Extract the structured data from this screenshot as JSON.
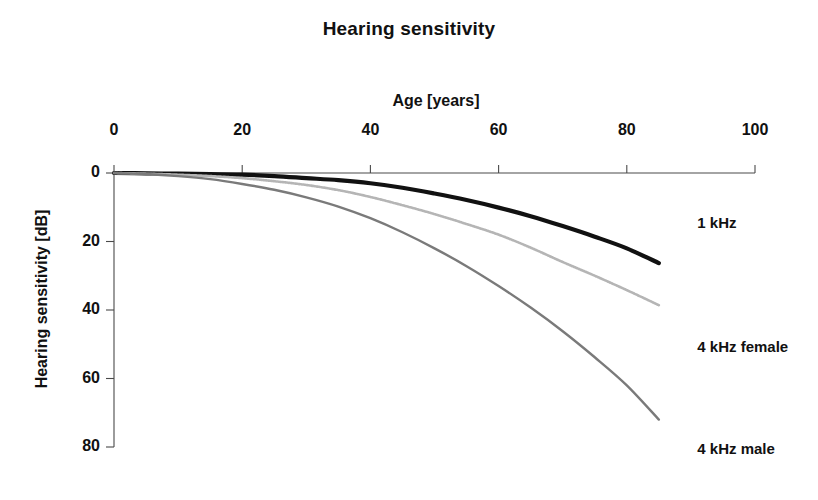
{
  "chart_data": {
    "type": "line",
    "title": "Hearing sensitivity",
    "xlabel": "Age [years]",
    "ylabel": "Hearing sensitivity [dB]",
    "xlim": [
      0,
      100
    ],
    "ylim": [
      0,
      80
    ],
    "y_inverted": true,
    "grid": false,
    "legend_position": "inline-right-of-curve-ends",
    "xticks": [
      0,
      20,
      40,
      60,
      80,
      100
    ],
    "xtick_labels": [
      "0",
      "20",
      "40",
      "60",
      "80",
      "100"
    ],
    "yticks": [
      0,
      20,
      40,
      60,
      80
    ],
    "ytick_labels": [
      "0",
      "20",
      "40",
      "60",
      "80"
    ],
    "x": [
      0,
      5,
      10,
      15,
      20,
      25,
      30,
      35,
      40,
      45,
      50,
      55,
      60,
      65,
      70,
      75,
      80,
      85
    ],
    "series": [
      {
        "name": "1 kHz",
        "label": "1 kHz",
        "color": "#111111",
        "style": "solid-thick",
        "width": 4.2,
        "values": [
          0,
          0.1,
          0.2,
          0.3,
          0.5,
          0.9,
          1.5,
          2.1,
          3.0,
          4.3,
          6.0,
          7.9,
          10.1,
          12.6,
          15.5,
          18.6,
          22.0,
          26.3
        ],
        "label_x": 91,
        "label_y": 15
      },
      {
        "name": "4 kHz female",
        "label": "4 kHz female",
        "color": "#b5b5b5",
        "style": "dotted-fine",
        "width": 2.6,
        "values": [
          0,
          0.2,
          0.5,
          0.9,
          1.5,
          2.4,
          3.5,
          5.0,
          7.0,
          9.4,
          12.0,
          14.9,
          18.0,
          21.8,
          26.0,
          30.0,
          34.2,
          38.6
        ],
        "label_x": 91,
        "label_y": 51
      },
      {
        "name": "4 kHz male",
        "label": "4 kHz male",
        "color": "#7a7a7a",
        "style": "solid-thin",
        "width": 2.4,
        "values": [
          0,
          0.3,
          0.9,
          1.8,
          3.2,
          4.9,
          7.1,
          9.8,
          13.2,
          17.3,
          22.0,
          27.2,
          33.0,
          39.3,
          46.2,
          53.8,
          62.0,
          72.0
        ],
        "label_x": 91,
        "label_y": 81
      }
    ]
  },
  "colors": {
    "background": "#ffffff",
    "text": "#111111",
    "axis": "#4a4a4a",
    "series_1khz": "#111111",
    "series_4khz_female": "#b5b5b5",
    "series_4khz_male": "#7a7a7a"
  }
}
